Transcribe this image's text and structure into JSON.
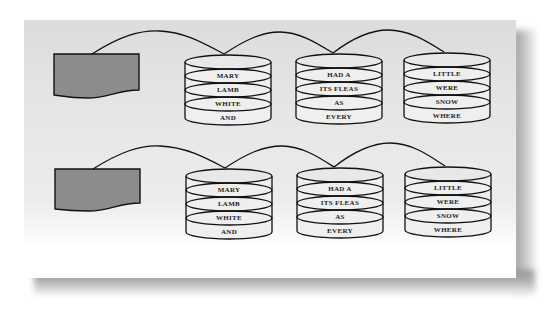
{
  "diagram": {
    "colors": {
      "background_top": "#dcdcdc",
      "document_fill": "#8c8c8c",
      "stroke": "#111111",
      "cylinder_fill": "#eeeeee"
    },
    "rows": [
      {
        "cylinders": [
          {
            "labels": [
              "MARY",
              "LAMB",
              "WHITE",
              "AND"
            ]
          },
          {
            "labels": [
              "HAD A",
              "ITS FLEAS",
              "AS",
              "EVERY"
            ]
          },
          {
            "labels": [
              "LITTLE",
              "WERE",
              "SNOW",
              "WHERE"
            ]
          }
        ]
      },
      {
        "cylinders": [
          {
            "labels": [
              "MARY",
              "LAMB",
              "WHITE",
              "AND"
            ]
          },
          {
            "labels": [
              "HAD A",
              "ITS FLEAS",
              "AS",
              "EVERY"
            ]
          },
          {
            "labels": [
              "LITTLE",
              "WERE",
              "SNOW",
              "WHERE"
            ]
          }
        ]
      }
    ]
  }
}
